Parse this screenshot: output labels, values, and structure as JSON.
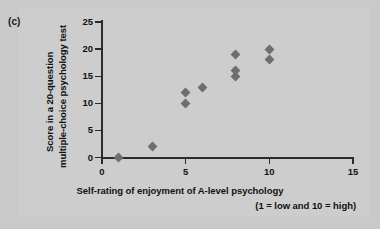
{
  "panel": {
    "label": "(c)"
  },
  "axis_titles": {
    "y_line1": "Score in a 20-question",
    "y_line2": "multiple-choice psychology test",
    "x_line1": "Self-rating of enjoyment of A-level psychology",
    "x_line2": "(1 = low and 10 = high)"
  },
  "colors": {
    "background": "#c9c9c9",
    "marker": "#6e6e6e",
    "axis": "#2b2b2b",
    "text": "#111111"
  },
  "chart_data": {
    "type": "scatter",
    "title": "(c)",
    "xlabel": "Self-rating of enjoyment of A-level psychology (1 = low and 10 = high)",
    "ylabel": "Score in a 20-question multiple-choice psychology test",
    "xlim": [
      0,
      15
    ],
    "ylim": [
      0,
      25
    ],
    "xticks": [
      0,
      5,
      10,
      15
    ],
    "yticks": [
      0,
      5,
      10,
      15,
      20,
      25
    ],
    "xtick_labels": [
      "0",
      "5",
      "10",
      "15"
    ],
    "ytick_labels": [
      "0",
      "5",
      "10",
      "15",
      "20",
      "25"
    ],
    "grid": false,
    "legend": null,
    "marker": "diamond",
    "points": [
      {
        "x": 1,
        "y": 0
      },
      {
        "x": 3,
        "y": 2
      },
      {
        "x": 5,
        "y": 10
      },
      {
        "x": 5,
        "y": 12
      },
      {
        "x": 6,
        "y": 13
      },
      {
        "x": 8,
        "y": 15
      },
      {
        "x": 8,
        "y": 16
      },
      {
        "x": 8,
        "y": 19
      },
      {
        "x": 10,
        "y": 18
      },
      {
        "x": 10,
        "y": 20
      }
    ]
  }
}
